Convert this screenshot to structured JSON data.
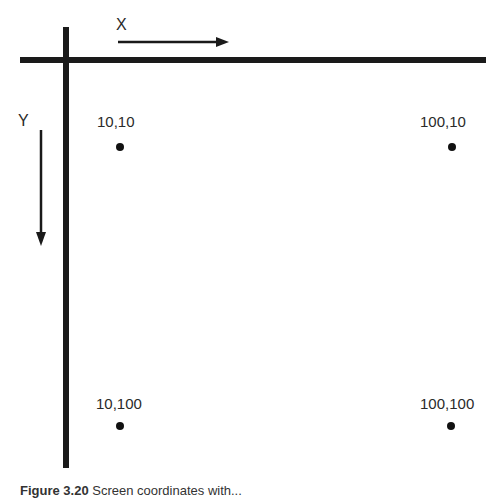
{
  "diagram": {
    "x_axis_label": "X",
    "y_axis_label": "Y",
    "points": [
      {
        "label": "10,10",
        "x": 10,
        "y": 10
      },
      {
        "label": "100,10",
        "x": 100,
        "y": 10
      },
      {
        "label": "10,100",
        "x": 10,
        "y": 100
      },
      {
        "label": "100,100",
        "x": 100,
        "y": 100
      }
    ],
    "caption_prefix": "Figure 3.20",
    "caption_text": " Screen coordinates with..."
  }
}
